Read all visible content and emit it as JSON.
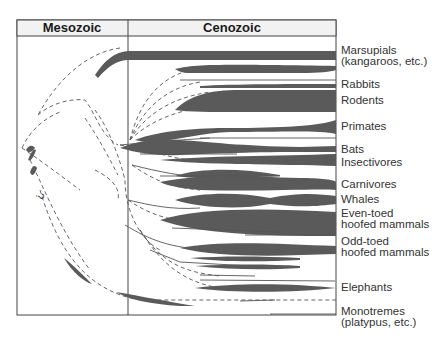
{
  "header": {
    "mesozoic": "Mesozoic",
    "cenozoic": "Cenozoic"
  },
  "labels": [
    {
      "line1": "Marsupials",
      "line2": "(kangaroos, etc.)"
    },
    {
      "line1": "Rabbits"
    },
    {
      "line1": "Rodents"
    },
    {
      "line1": "Primates"
    },
    {
      "line1": "Bats"
    },
    {
      "line1": "Insectivores"
    },
    {
      "line1": "Carnivores"
    },
    {
      "line1": "Whales"
    },
    {
      "line1": "Even-toed",
      "line2": "hoofed mammals"
    },
    {
      "line1": "Odd-toed",
      "line2": "hoofed mammals"
    },
    {
      "line1": "Elephants"
    },
    {
      "line1": "Monotremes",
      "line2": "(platypus, etc.)"
    }
  ],
  "annotations": {
    "uncertain_mark": "?"
  },
  "colors": {
    "branch_fill": "#5a5a5a",
    "header_bg": "#f2f2f2",
    "frame": "#444444"
  }
}
